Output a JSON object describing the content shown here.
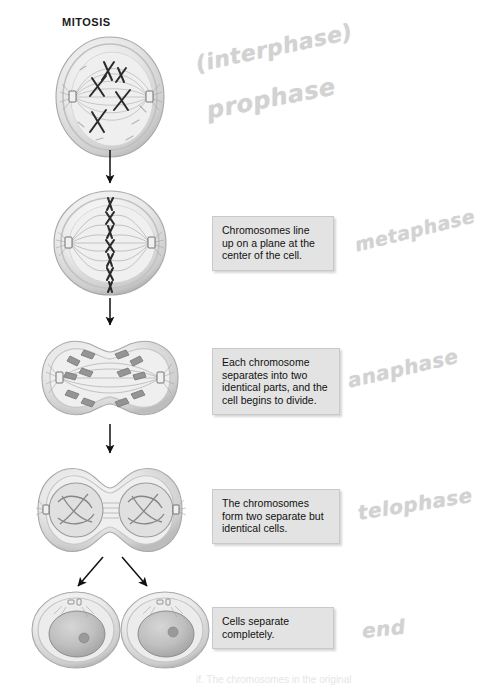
{
  "document": {
    "title": "MITOSIS",
    "type": "textbook-diagram",
    "subject": "Cell division stages"
  },
  "callouts": [
    {
      "id": "metaphase-callout",
      "text": "Chromosomes line up on a plane at the center of the cell."
    },
    {
      "id": "anaphase-callout",
      "text": "Each chromosome separates into two identical parts, and the cell begins to divide."
    },
    {
      "id": "telophase-callout",
      "text": "The chromosomes form two separate but identical cells."
    },
    {
      "id": "end-callout",
      "text": "Cells separate completely."
    }
  ],
  "annotations": [
    {
      "id": "interphase-note",
      "text": "(interphase)"
    },
    {
      "id": "prophase-note",
      "text": "prophase"
    },
    {
      "id": "metaphase-note",
      "text": "metaphase"
    },
    {
      "id": "anaphase-note",
      "text": "anaphase"
    },
    {
      "id": "telophase-note",
      "text": "telophase"
    },
    {
      "id": "end-note",
      "text": "end"
    }
  ],
  "stages": [
    {
      "id": "stage-prophase",
      "name": "prophase-cell-illustration"
    },
    {
      "id": "stage-metaphase",
      "name": "metaphase-cell-illustration"
    },
    {
      "id": "stage-anaphase",
      "name": "anaphase-cell-illustration"
    },
    {
      "id": "stage-telophase",
      "name": "telophase-cell-illustration"
    },
    {
      "id": "stage-daughter-cells",
      "name": "daughter-cells-illustration"
    }
  ],
  "cropped_caption": {
    "text": "if. The chromosomes in the original"
  },
  "colors": {
    "callout_fill": "#e3e3e3",
    "callout_border": "#c9c9c9",
    "pencil": "#d2d2d2",
    "ink": "#1a1a1a",
    "cell_membrane": "#b5b5b5",
    "cytoplasm": "#ededed"
  }
}
